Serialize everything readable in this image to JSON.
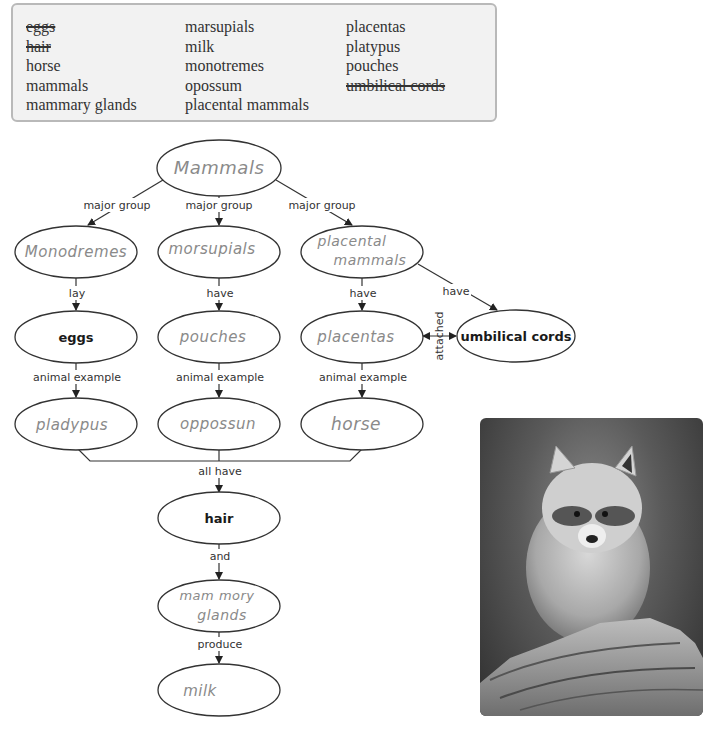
{
  "word_bank": {
    "columns": [
      [
        {
          "text": "eggs",
          "struck": true
        },
        {
          "text": "hair",
          "struck": true
        },
        {
          "text": "horse",
          "struck": false
        },
        {
          "text": "mammals",
          "struck": false
        },
        {
          "text": "mammary glands",
          "struck": false
        }
      ],
      [
        {
          "text": "marsupials",
          "struck": false
        },
        {
          "text": "milk",
          "struck": false
        },
        {
          "text": "monotremes",
          "struck": false
        },
        {
          "text": "opossum",
          "struck": false
        },
        {
          "text": "placental mammals",
          "struck": false
        }
      ],
      [
        {
          "text": "placentas",
          "struck": false
        },
        {
          "text": "platypus",
          "struck": false
        },
        {
          "text": "pouches",
          "struck": false
        },
        {
          "text": "umbilical cords",
          "struck": true
        }
      ]
    ]
  },
  "concept_map": {
    "nodes": {
      "mammals": {
        "text": "Mammals",
        "handwritten": true
      },
      "monotremes": {
        "text": "Monodremes",
        "handwritten": true
      },
      "marsupials": {
        "text": "morsupials",
        "handwritten": true
      },
      "placental_line1": {
        "text": "placental",
        "handwritten": true
      },
      "placental_line2": {
        "text": "mammals",
        "handwritten": true
      },
      "eggs": {
        "text": "eggs",
        "handwritten": false
      },
      "pouches": {
        "text": "pouches",
        "handwritten": true
      },
      "placentas": {
        "text": "placentas",
        "handwritten": true
      },
      "umbilical_cords": {
        "text": "umbilical cords",
        "handwritten": false
      },
      "platypus": {
        "text": "pladypus",
        "handwritten": true
      },
      "opossum": {
        "text": "oppossun",
        "handwritten": true
      },
      "horse": {
        "text": "horse",
        "handwritten": true
      },
      "hair": {
        "text": "hair",
        "handwritten": false
      },
      "mammary_line1": {
        "text": "mam mory",
        "handwritten": true
      },
      "mammary_line2": {
        "text": "glands",
        "handwritten": true
      },
      "milk": {
        "text": "milk",
        "handwritten": true
      }
    },
    "links": {
      "major_group_1": "major group",
      "major_group_2": "major group",
      "major_group_3": "major group",
      "lay": "lay",
      "have_1": "have",
      "have_2": "have",
      "have_3": "have",
      "animal_example_1": "animal example",
      "animal_example_2": "animal example",
      "animal_example_3": "animal example",
      "attached": "attached",
      "all_have": "all have",
      "and": "and",
      "produce": "produce"
    }
  },
  "photo": {
    "subject": "raccoon on log",
    "style": "grayscale"
  }
}
